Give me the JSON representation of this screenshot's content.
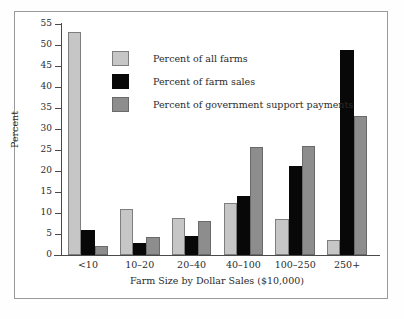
{
  "chart_data": {
    "type": "bar",
    "title": "",
    "xlabel": "Farm Size by Dollar Sales ($10,000)",
    "ylabel": "Percent",
    "ylim": [
      0,
      55
    ],
    "yticks": [
      0,
      5,
      10,
      15,
      20,
      25,
      30,
      35,
      40,
      45,
      50,
      55
    ],
    "grid": false,
    "legend_position": "upper-center-left",
    "categories": [
      "<10",
      "10–20",
      "20–40",
      "40–100",
      "100–250",
      "250+"
    ],
    "series": [
      {
        "name": "Percent of all farms",
        "color": "#c6c6c6",
        "values": [
          53.2,
          10.9,
          8.9,
          12.3,
          8.6,
          3.6
        ]
      },
      {
        "name": "Percent of farm sales",
        "color": "#080808",
        "values": [
          5.9,
          2.9,
          4.5,
          14.0,
          21.2,
          48.7
        ]
      },
      {
        "name": "Percent of government support payments",
        "color": "#8d8d8d",
        "values": [
          2.2,
          4.2,
          8.2,
          25.8,
          25.9,
          33.2
        ]
      }
    ]
  },
  "figure": {
    "frame_color": "#9a9a9a",
    "background": "#ffffff",
    "axis_color": "#4a4a4a",
    "text_color": "#2b2b2b"
  }
}
